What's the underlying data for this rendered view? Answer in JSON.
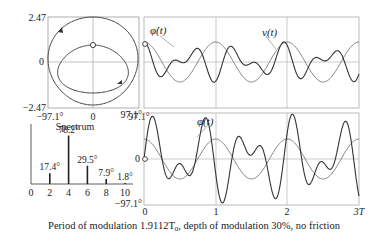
{
  "caption": "Period of modulation 1.9112T",
  "caption_sub": "0",
  "caption_rest": ", depth of modulation 30%, no friction",
  "chart_data": [
    {
      "type": "line",
      "title": "Phase portrait",
      "xlabel": "φ",
      "ylabel": "φ̇",
      "xlim": [
        -97.1,
        97.1
      ],
      "ylim": [
        -2.47,
        2.47
      ],
      "x_ticks": [
        "-97.1°",
        "0",
        "97.1°"
      ],
      "y_ticks": [
        "2.47",
        "0",
        "-2.47"
      ],
      "grid": true
    },
    {
      "type": "bar",
      "title": "Spectrum",
      "categories": [
        2,
        4,
        6,
        8,
        10
      ],
      "values": [
        17.4,
        78.2,
        29.5,
        7.9,
        1.8
      ],
      "labels": [
        "17.4°",
        "78.2°",
        "29.5°",
        "7.9°",
        "1.8°"
      ],
      "x_ticks": [
        "0",
        "2",
        "4",
        "6",
        "8",
        "10"
      ]
    },
    {
      "type": "line",
      "title": "Angular velocity and modulation",
      "series": [
        {
          "name": "φ̇(t)",
          "label": "φ̇(t)"
        },
        {
          "name": "ν(t)",
          "label": "ν(t)"
        }
      ],
      "xlim": [
        0,
        3
      ],
      "grid": true
    },
    {
      "type": "line",
      "title": "Angle vs time",
      "series": [
        {
          "name": "φ(t)",
          "label": "φ(t)"
        }
      ],
      "xlim": [
        0,
        3
      ],
      "ylim": [
        -97.1,
        97.1
      ],
      "x_ticks": [
        "0",
        "1",
        "2",
        "3T"
      ],
      "y_ticks": [
        "97.1°",
        "0",
        "-97.1°"
      ],
      "grid": true
    }
  ],
  "labels": {
    "phase_y_top": "2.47",
    "phase_y_mid": "0",
    "phase_y_bot": "−2.47",
    "phase_x_left": "−97.1°",
    "phase_x_mid": "0",
    "phase_x_right": "97.1°",
    "spectrum_title": "Spectrum",
    "bar_labels": [
      "17.4°",
      "78.2°",
      "29.5°",
      "7.9°",
      "1.8°"
    ],
    "spec_ticks": [
      "0",
      "2",
      "4",
      "6",
      "8",
      "10"
    ],
    "phidot": "φ̇(t)",
    "nu": "ν(t)",
    "phi": "φ(t)",
    "bot_y_top": "97.1°",
    "bot_y_mid": "0",
    "bot_y_bot": "−97.1°",
    "bot_x": [
      "0",
      "1",
      "2",
      "3T"
    ]
  }
}
